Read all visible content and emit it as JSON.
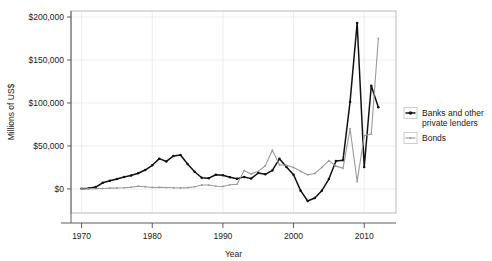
{
  "chart_data": {
    "type": "line",
    "title": "",
    "xlabel": "Year",
    "ylabel": "Millions of US$",
    "xlim": [
      1968.5,
      2014.5
    ],
    "ylim": [
      -28000,
      207000
    ],
    "grid": true,
    "legend_position": "right",
    "xticks": [
      1970,
      1980,
      1990,
      2000,
      2010
    ],
    "xticklabels": [
      "1970",
      "1980",
      "1990",
      "2000",
      "2010"
    ],
    "yticks": [
      0,
      50000,
      100000,
      150000,
      200000
    ],
    "yticklabels": [
      "$0",
      "$50,000",
      "$100,000",
      "$150,000",
      "$200,000"
    ],
    "x": [
      1970,
      1971,
      1972,
      1973,
      1974,
      1975,
      1976,
      1977,
      1978,
      1979,
      1980,
      1981,
      1982,
      1983,
      1984,
      1985,
      1986,
      1987,
      1988,
      1989,
      1990,
      1991,
      1992,
      1993,
      1994,
      1995,
      1996,
      1997,
      1998,
      1999,
      2000,
      2001,
      2002,
      2003,
      2004,
      2005,
      2006,
      2007,
      2008,
      2009,
      2010,
      2011,
      2012
    ],
    "series": [
      {
        "name": "Banks and other private lenders",
        "color": "#111111",
        "marker": "dot",
        "values": [
          200,
          900,
          2200,
          7200,
          9600,
          11500,
          13800,
          15600,
          18200,
          22000,
          27500,
          35200,
          32000,
          38400,
          39500,
          29000,
          20000,
          13000,
          12500,
          16500,
          16000,
          13500,
          11800,
          14000,
          12000,
          18500,
          17000,
          21500,
          35000,
          25500,
          16500,
          -2000,
          -14000,
          -10500,
          -2000,
          11500,
          32500,
          33500,
          101500,
          193000,
          25500,
          120000,
          95000
        ]
      },
      {
        "name": "Bonds",
        "color": "#9a9a9a",
        "marker": "dot",
        "values": [
          0,
          200,
          300,
          500,
          900,
          1100,
          1300,
          2000,
          3200,
          2600,
          1700,
          1800,
          1600,
          1300,
          1100,
          1500,
          2500,
          4600,
          4500,
          3200,
          2900,
          4800,
          5500,
          21500,
          17500,
          20500,
          27000,
          45000,
          28000,
          27500,
          25000,
          20500,
          16500,
          18000,
          25000,
          33000,
          26500,
          24000,
          70000,
          8500,
          62000,
          64000,
          175000
        ]
      }
    ]
  },
  "legend": {
    "items": [
      {
        "label_line1": "Banks and other",
        "label_line2": "private lenders"
      },
      {
        "label_line1": "Bonds",
        "label_line2": ""
      }
    ]
  }
}
